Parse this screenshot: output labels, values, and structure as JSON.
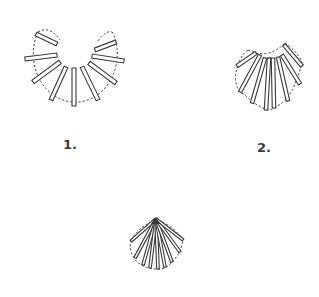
{
  "diagram": {
    "figures": [
      {
        "id": "fig-1",
        "label": "1.",
        "rod_count": 9,
        "shape": "wide semicircular arc"
      },
      {
        "id": "fig-2",
        "label": "2.",
        "rod_count": 8,
        "shape": "narrower fan"
      },
      {
        "id": "fig-3",
        "label": "",
        "rod_count": 9,
        "shape": "tight fan converging to apex"
      }
    ],
    "colors": {
      "line": "#3a3a3a",
      "background": "#ffffff"
    }
  }
}
